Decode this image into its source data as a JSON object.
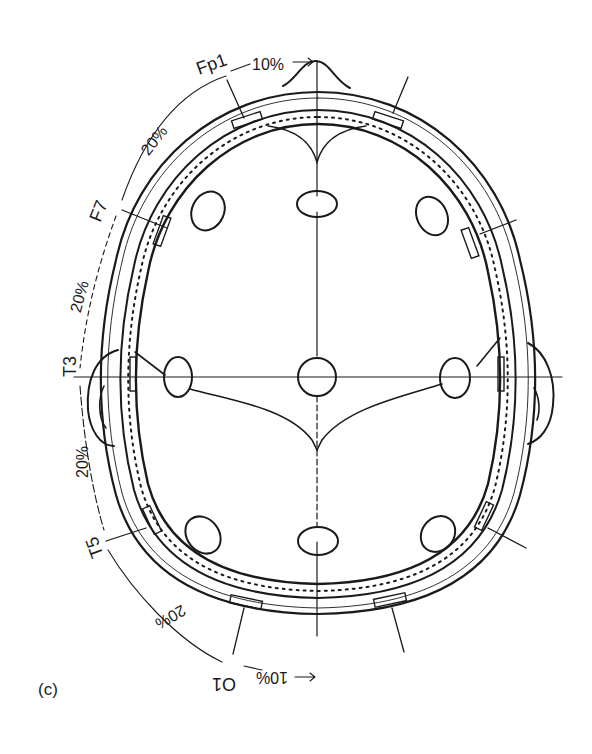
{
  "figure": {
    "panel_label": "(c)",
    "electrodes": {
      "fp1": "Fp1",
      "f7": "F7",
      "t3": "T3",
      "t5": "T5",
      "o1": "O1"
    },
    "distances": {
      "nasion_to_fp1": "10%",
      "fp1_to_f7": "20%",
      "f7_to_t3": "20%",
      "t3_to_t5": "20%",
      "t5_to_o1": "20%",
      "o1_to_inion": "10%"
    },
    "colors": {
      "ink": "#1a1a1a",
      "background": "#ffffff"
    }
  }
}
